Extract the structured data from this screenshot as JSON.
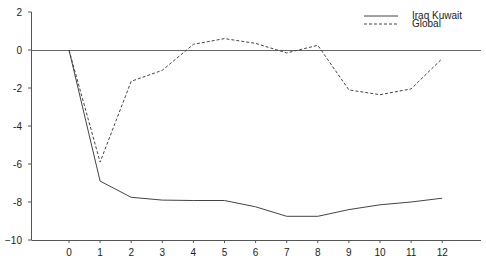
{
  "chart_data": {
    "type": "line",
    "title": "",
    "xlabel": "",
    "ylabel": "",
    "x": [
      0,
      1,
      2,
      3,
      4,
      5,
      6,
      7,
      8,
      9,
      10,
      11,
      12
    ],
    "ylim": [
      -10,
      2
    ],
    "yticks": [
      2,
      0,
      -2,
      -4,
      -6,
      -8,
      -10
    ],
    "ytick_labels": [
      "2",
      "0",
      "-2",
      "-4",
      "-6",
      "-8",
      "−10"
    ],
    "xtick_labels": [
      "0",
      "1",
      "2",
      "3",
      "4",
      "5",
      "6",
      "7",
      "8",
      "9",
      "10",
      "11",
      "12"
    ],
    "grid": false,
    "legend_position": "upper right",
    "series": [
      {
        "name": "Iraq Kuwait",
        "style": "solid",
        "values": [
          0,
          -6.9,
          -7.75,
          -7.9,
          -7.92,
          -7.92,
          -8.25,
          -8.75,
          -8.75,
          -8.4,
          -8.15,
          -8.0,
          -7.8
        ]
      },
      {
        "name": "Global",
        "style": "dashed",
        "values": [
          0,
          -5.9,
          -1.65,
          -1.07,
          0.3,
          0.6,
          0.35,
          -0.15,
          0.25,
          -2.1,
          -2.35,
          -2.05,
          -0.45
        ]
      }
    ]
  }
}
